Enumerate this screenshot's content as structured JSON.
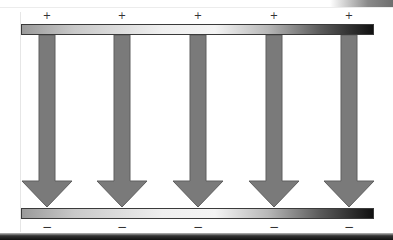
{
  "diagram": {
    "top_plate": {
      "charge_symbol": "+",
      "label": "positive plate"
    },
    "bottom_plate": {
      "charge_symbol": "−",
      "label": "negative plate"
    },
    "field_arrows": [
      {
        "x": 47,
        "direction": "down"
      },
      {
        "x": 122,
        "direction": "down"
      },
      {
        "x": 198,
        "direction": "down"
      },
      {
        "x": 274,
        "direction": "down"
      },
      {
        "x": 349,
        "direction": "down"
      }
    ],
    "plus_signs": [
      "+",
      "+",
      "+",
      "+",
      "+"
    ],
    "minus_signs": [
      "−",
      "−",
      "−",
      "−",
      "−"
    ],
    "colors": {
      "arrow_fill": "#7a7a7a",
      "arrow_stroke": "#5e5e5e",
      "plate_border": "#3a3a3a",
      "background": "#ffffff"
    }
  }
}
